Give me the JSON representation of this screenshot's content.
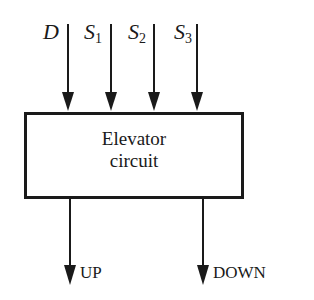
{
  "diagram": {
    "block": {
      "line1": "Elevator",
      "line2": "circuit"
    },
    "inputs": [
      {
        "name": "D",
        "sub": ""
      },
      {
        "name": "S",
        "sub": "1"
      },
      {
        "name": "S",
        "sub": "2"
      },
      {
        "name": "S",
        "sub": "3"
      }
    ],
    "outputs": [
      {
        "name": "UP"
      },
      {
        "name": "DOWN"
      }
    ],
    "colors": {
      "stroke": "#1a1a1a",
      "background": "#ffffff"
    }
  }
}
